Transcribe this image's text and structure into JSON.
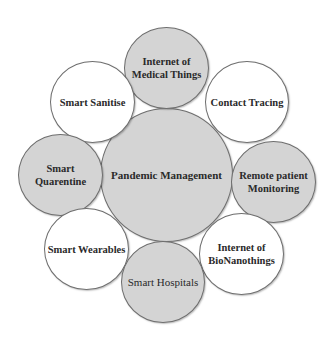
{
  "diagram": {
    "center": {
      "label": "Pandemic Management",
      "fill": "#d4d4d4"
    },
    "nodes": [
      {
        "label": "Internet of\nMedical Things",
        "fill": "#d4d4d4"
      },
      {
        "label": "Contact Tracing",
        "fill": "#ffffff"
      },
      {
        "label": "Remote patient\nMonitoring",
        "fill": "#d4d4d4"
      },
      {
        "label": "Internet of\nBioNanothings",
        "fill": "#ffffff"
      },
      {
        "label": "Smart Hospitals",
        "fill": "#d4d4d4"
      },
      {
        "label": "Smart Wearables",
        "fill": "#ffffff"
      },
      {
        "label": "Smart\nQuarentine",
        "fill": "#d4d4d4"
      },
      {
        "label": "Smart Sanitise",
        "fill": "#ffffff"
      }
    ],
    "colors": {
      "gray_fill": "#d4d4d4",
      "white_fill": "#ffffff",
      "outline": "#6e6e6e",
      "text": "#2a2a2a"
    }
  }
}
